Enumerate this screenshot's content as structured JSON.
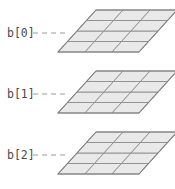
{
  "figure": {
    "title": "",
    "background_color": "#ffffff",
    "width": 175,
    "height": 189
  },
  "style": {
    "cell_fill": "#e9e9e9",
    "cell_stroke": "#8d8d8d",
    "outline_stroke": "#7e7e7e",
    "leader_stroke": "#9a9a9a",
    "label_color": "#4a4a4a"
  },
  "grid": {
    "columns": 3,
    "rows": 4,
    "skew_px": 38,
    "cell_width": 27,
    "cell_height": 10.5
  },
  "slices": [
    {
      "label": "b[0]",
      "label_x": 7,
      "label_y": 37,
      "origin_x": 58,
      "origin_y": 52,
      "leader_x1": 33,
      "leader_x2": 68,
      "leader_y": 33
    },
    {
      "label": "b[1]",
      "label_x": 7,
      "label_y": 98,
      "origin_x": 58,
      "origin_y": 113,
      "leader_x1": 33,
      "leader_x2": 68,
      "leader_y": 94
    },
    {
      "label": "b[2]",
      "label_x": 7,
      "label_y": 159,
      "origin_x": 58,
      "origin_y": 174,
      "leader_x1": 33,
      "leader_x2": 68,
      "leader_y": 155
    }
  ]
}
